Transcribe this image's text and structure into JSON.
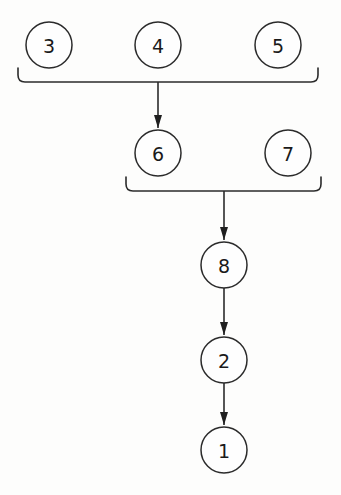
{
  "diagram": {
    "type": "directed-tree",
    "background_color": "#fdfdfc",
    "stroke_color": "#2b2b2b",
    "node_fill_color": "#fefefe",
    "label_color": "#1a1a1a",
    "node_radius": 23,
    "canvas": {
      "width": 341,
      "height": 495
    },
    "nodes": [
      {
        "id": "n3",
        "label": "3",
        "cx": 49,
        "cy": 45,
        "row": 1
      },
      {
        "id": "n4",
        "label": "4",
        "cx": 158,
        "cy": 45,
        "row": 1
      },
      {
        "id": "n5",
        "label": "5",
        "cx": 278,
        "cy": 45,
        "row": 1
      },
      {
        "id": "n6",
        "label": "6",
        "cx": 158,
        "cy": 153,
        "row": 2
      },
      {
        "id": "n7",
        "label": "7",
        "cx": 288,
        "cy": 153,
        "row": 2
      },
      {
        "id": "n8",
        "label": "8",
        "cx": 224,
        "cy": 265,
        "row": 3
      },
      {
        "id": "n2",
        "label": "2",
        "cx": 224,
        "cy": 360,
        "row": 4
      },
      {
        "id": "n1",
        "label": "1",
        "cx": 224,
        "cy": 450,
        "row": 5
      }
    ],
    "brackets": [
      {
        "id": "bracket-top",
        "sources": [
          "n3",
          "n4",
          "n5"
        ],
        "target": "n6",
        "left_x": 18,
        "right_x": 318,
        "top_y": 68,
        "bar_y": 82,
        "junction_x": 158,
        "arrow_tip_y": 128
      },
      {
        "id": "bracket-middle",
        "sources": [
          "n6",
          "n7"
        ],
        "target": "n8",
        "left_x": 126,
        "right_x": 321,
        "top_y": 177,
        "bar_y": 191,
        "junction_x": 224,
        "arrow_tip_y": 240
      }
    ],
    "edges": [
      {
        "id": "e-8-2",
        "from": "n8",
        "to": "n2",
        "x": 224,
        "y1": 288,
        "y2": 335
      },
      {
        "id": "e-2-1",
        "from": "n2",
        "to": "n1",
        "x": 224,
        "y1": 383,
        "y2": 425
      }
    ],
    "arrow_head": {
      "half_width": 4,
      "length": 13
    }
  }
}
